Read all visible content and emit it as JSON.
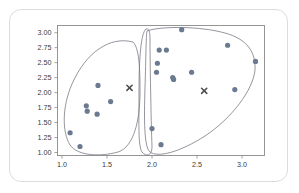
{
  "card": {
    "name": "chart-card"
  },
  "chart_data": {
    "type": "scatter",
    "title": "",
    "xlabel": "",
    "ylabel": "",
    "xlim": [
      0.95,
      3.25
    ],
    "ylim": [
      0.95,
      3.12
    ],
    "xticks": [
      "1.0",
      "1.5",
      "2.0",
      "2.5",
      "3.0"
    ],
    "xtick_values": [
      1.0,
      1.5,
      2.0,
      2.5,
      3.0
    ],
    "yticks": [
      "1.00",
      "1.25",
      "1.50",
      "1.75",
      "2.00",
      "2.25",
      "2.50",
      "2.75",
      "3.00"
    ],
    "ytick_values": [
      1.0,
      1.25,
      1.5,
      1.75,
      2.0,
      2.25,
      2.5,
      2.75,
      3.0
    ],
    "grid": false,
    "legend": "none",
    "point_color": "#6b7a90",
    "hull_color": "#7a7a85",
    "centroid_color": "#4a4a4a",
    "series": [
      {
        "name": "cluster-1",
        "points": [
          [
            1.09,
            1.33
          ],
          [
            1.2,
            1.1
          ],
          [
            1.27,
            1.78
          ],
          [
            1.28,
            1.69
          ],
          [
            1.39,
            1.64
          ],
          [
            1.4,
            2.12
          ],
          [
            1.54,
            1.85
          ],
          [
            2.0,
            1.4
          ],
          [
            2.05,
            2.34
          ],
          [
            2.06,
            2.49
          ],
          [
            2.08,
            2.71
          ]
        ]
      },
      {
        "name": "cluster-2",
        "points": [
          [
            2.1,
            1.13
          ],
          [
            2.16,
            2.71
          ],
          [
            2.23,
            2.25
          ],
          [
            2.24,
            2.22
          ],
          [
            2.33,
            3.05
          ],
          [
            2.44,
            2.34
          ],
          [
            2.84,
            2.79
          ],
          [
            2.92,
            2.05
          ],
          [
            3.15,
            2.52
          ]
        ]
      }
    ],
    "centroids": [
      {
        "name": "centroid-left",
        "x": 1.75,
        "y": 2.08
      },
      {
        "name": "centroid-right",
        "x": 2.58,
        "y": 2.03
      }
    ],
    "hulls": [
      {
        "name": "hull-left"
      },
      {
        "name": "hull-middle"
      },
      {
        "name": "hull-right"
      }
    ]
  }
}
